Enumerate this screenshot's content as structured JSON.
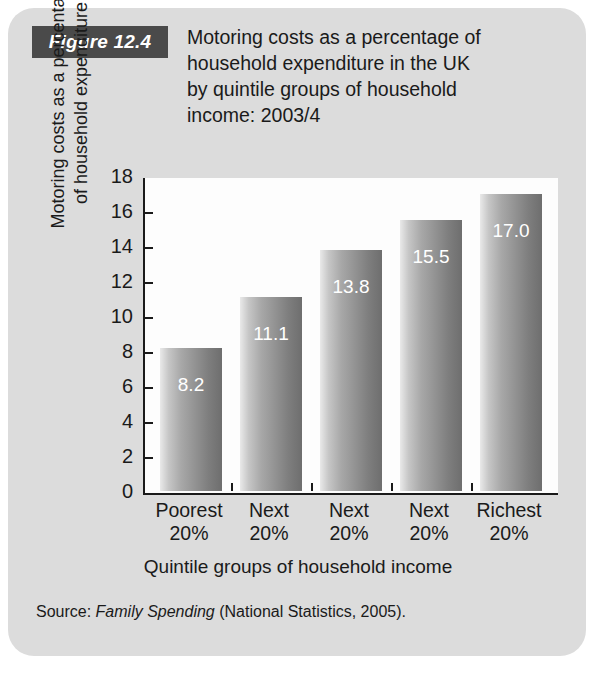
{
  "figure": {
    "badge_label": "Figure 12.4",
    "title": "Motoring costs as a percentage of\nhousehold expenditure in the UK\nby quintile groups of household\nincome: 2003/4"
  },
  "source": {
    "prefix": "Source: ",
    "publication": "Family Spending",
    "suffix": " (National Statistics, 2005)."
  },
  "colors": {
    "card_background": "#dcdcdc",
    "badge_background": "#4a4a4a",
    "plot_background": "#fdfdfd",
    "axis": "#1a1a1a",
    "bar_light": "#e9e9e9",
    "bar_dark": "#6e6e6e",
    "value_label": "#ffffff"
  },
  "chart_data": {
    "type": "bar",
    "title": "Motoring costs as a percentage of household expenditure in the UK by quintile groups of household income: 2003/4",
    "categories": [
      "Poorest\n20%",
      "Next\n20%",
      "Next\n20%",
      "Next\n20%",
      "Richest\n20%"
    ],
    "values": [
      8.2,
      11.1,
      13.8,
      15.5,
      17.0
    ],
    "value_labels": [
      "8.2",
      "11.1",
      "13.8",
      "15.5",
      "17.0"
    ],
    "xlabel": "Quintile groups of household income",
    "ylabel": "Motoring costs as a percentage\nof household expenditure",
    "ylim": [
      0,
      18
    ],
    "yticks": [
      0,
      2,
      4,
      6,
      8,
      10,
      12,
      14,
      16,
      18
    ],
    "ytick_labels": [
      "0",
      "2",
      "4",
      "6",
      "8",
      "10",
      "12",
      "14",
      "16",
      "18"
    ],
    "grid": false,
    "legend": null
  }
}
